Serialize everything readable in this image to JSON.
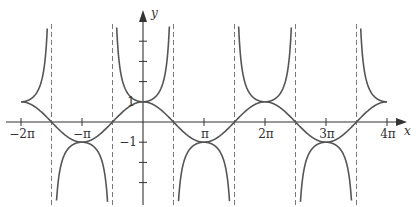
{
  "chart_data": {
    "type": "line",
    "title": "",
    "xlabel": "x",
    "ylabel": "y",
    "xlim": [
      -6.2832,
      12.5664
    ],
    "ylim": [
      -4,
      5.5
    ],
    "grid": false,
    "legend": null,
    "x_ticks": [
      {
        "value": -6.2832,
        "label": "−2π"
      },
      {
        "value": -3.1416,
        "label": "−π"
      },
      {
        "value": 3.1416,
        "label": "π"
      },
      {
        "value": 6.2832,
        "label": "2π"
      },
      {
        "value": 9.4248,
        "label": "3π"
      },
      {
        "value": 12.5664,
        "label": "4π"
      }
    ],
    "y_ticks": [
      {
        "value": 1,
        "label": "1"
      },
      {
        "value": 2,
        "label": ""
      },
      {
        "value": 3,
        "label": ""
      },
      {
        "value": 4,
        "label": ""
      },
      {
        "value": -1,
        "label": "−1"
      },
      {
        "value": -2,
        "label": ""
      },
      {
        "value": -3,
        "label": ""
      }
    ],
    "series": [
      {
        "name": "y = sec x",
        "function": "sec(x)",
        "domain": [
          -6.2832,
          12.5664
        ],
        "style": "solid"
      },
      {
        "name": "y = cos x",
        "function": "cos(x)",
        "domain": [
          -6.2832,
          12.5664
        ],
        "style": "solid"
      }
    ],
    "asymptotes": {
      "type": "vertical-dashed",
      "x": [
        -4.7124,
        -1.5708,
        1.5708,
        4.7124,
        7.854,
        10.9956
      ],
      "labels": [
        "−3π/2",
        "−π/2",
        "π/2",
        "3π/2",
        "5π/2",
        "7π/2"
      ]
    },
    "key_points": [
      {
        "x": -6.2832,
        "y": 1
      },
      {
        "x": -3.1416,
        "y": -1
      },
      {
        "x": 0,
        "y": 1
      },
      {
        "x": 3.1416,
        "y": -1
      },
      {
        "x": 6.2832,
        "y": 1
      },
      {
        "x": 9.4248,
        "y": -1
      },
      {
        "x": 12.5664,
        "y": 1
      }
    ]
  },
  "axes": {
    "x_label": "x",
    "y_label": "y",
    "tick_labels": {
      "neg2pi": "−2π",
      "negpi": "−π",
      "pi": "π",
      "twopi": "2π",
      "threepi": "3π",
      "fourpi": "4π",
      "one": "1",
      "neg_one": "−1"
    }
  },
  "colors": {
    "curve": "#555555",
    "axis": "#333333",
    "asymptote": "#7a7a7a",
    "background": "#ffffff"
  }
}
